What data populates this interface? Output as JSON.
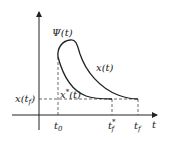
{
  "diagram": {
    "axes": {
      "horizontal_label": "t",
      "vertical_label": ""
    },
    "labels": {
      "psi": "Ψ(t)",
      "x_curve": "x(t)",
      "x_star_curve": "x",
      "x_star_sup": "*",
      "x_star_tail": "(t)",
      "x_tf_main": "x(t",
      "x_tf_sub": "f",
      "x_tf_close": ")",
      "t0_main": "t",
      "t0_sub": "0",
      "tf_star_main": "t",
      "tf_star_sup": "*",
      "tf_star_sub": "f",
      "tf_main": "t",
      "tf_sub": "f"
    },
    "colors": {
      "stroke": "#222222",
      "dash": "#444444",
      "background": "#ffffff"
    }
  }
}
